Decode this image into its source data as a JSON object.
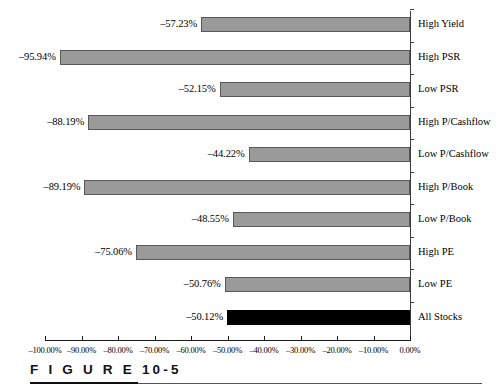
{
  "figure": {
    "caption": "F I G U R E  10-5",
    "caption_prefix": "F I G U R E",
    "caption_number": "10-5"
  },
  "chart_data": {
    "type": "bar",
    "orientation": "horizontal",
    "title": "",
    "subtitle": "",
    "xlabel": "",
    "ylabel": "",
    "xlim": [
      -100,
      0
    ],
    "grid": false,
    "legend": null,
    "categories": [
      "High Yield",
      "High PSR",
      "Low PSR",
      "High P/Cashflow",
      "Low P/Cashflow",
      "High P/Book",
      "Low P/Book",
      "High PE",
      "Low PE",
      "All Stocks"
    ],
    "values": [
      -57.23,
      -95.94,
      -52.15,
      -88.19,
      -44.22,
      -89.19,
      -48.55,
      -75.06,
      -50.76,
      -50.12
    ],
    "value_labels": [
      "–57.23%",
      "–95.94%",
      "–52.15%",
      "–88.19%",
      "–44.22%",
      "–89.19%",
      "–48.55%",
      "–75.06%",
      "–50.76%",
      "–50.12%"
    ],
    "bar_colors": [
      "#9a9a9a",
      "#9a9a9a",
      "#9a9a9a",
      "#9a9a9a",
      "#9a9a9a",
      "#9a9a9a",
      "#9a9a9a",
      "#9a9a9a",
      "#9a9a9a",
      "#000000"
    ],
    "highlight_category": "All Stocks",
    "highlight_color": "#000000",
    "bar_fill_color": "#9a9a9a",
    "bar_border_color": "#595959",
    "xticks": [
      -100,
      -90,
      -80,
      -70,
      -60,
      -50,
      -40,
      -30,
      -20,
      -10,
      0
    ],
    "xtick_labels": [
      "–100.00%",
      "–90.00%",
      "–80.00%",
      "–70.00%",
      "–60.00%",
      "–50.00%",
      "–40.00%",
      "–30.00%",
      "–20.00%",
      "–10.00%",
      "0.00%"
    ]
  }
}
